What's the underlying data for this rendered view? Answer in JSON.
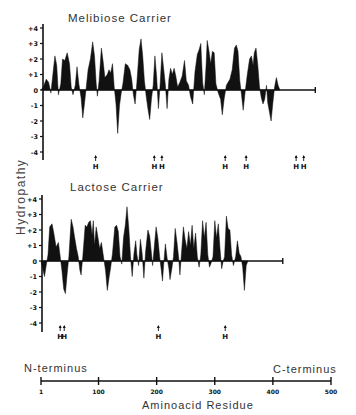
{
  "figure": {
    "ylabel": "Hydropathy",
    "xlabel": "Aminoacid Residue",
    "n_terminus_label": "N-terminus",
    "c_terminus_label": "C-terminus",
    "ink_color": "#111111"
  },
  "chart_data": [
    {
      "type": "area",
      "title": "Melibiose Carrier",
      "ylabel": "Hydropathy",
      "xlabel": "Aminoacid Residue",
      "ylim": [
        -4,
        4
      ],
      "yticks": [
        "+4",
        "+3",
        "+2",
        "+1",
        "0",
        "-1",
        "-2",
        "-3",
        "-4"
      ],
      "xlim": [
        1,
        500
      ],
      "sequence_end": 473,
      "profile": [
        [
          1,
          0
        ],
        [
          5,
          0.2
        ],
        [
          10,
          0.7
        ],
        [
          14,
          0.5
        ],
        [
          18,
          -0.2
        ],
        [
          22,
          1.2
        ],
        [
          25,
          2.2
        ],
        [
          28,
          1.6
        ],
        [
          31,
          -0.3
        ],
        [
          35,
          0.4
        ],
        [
          38,
          2.0
        ],
        [
          42,
          1.9
        ],
        [
          46,
          2.4
        ],
        [
          50,
          1.7
        ],
        [
          53,
          0.2
        ],
        [
          56,
          -0.3
        ],
        [
          60,
          0.3
        ],
        [
          63,
          1.5
        ],
        [
          66,
          0.4
        ],
        [
          70,
          -0.5
        ],
        [
          73,
          -1.8
        ],
        [
          76,
          -0.8
        ],
        [
          79,
          0.2
        ],
        [
          82,
          1.3
        ],
        [
          86,
          2.0
        ],
        [
          90,
          3.1
        ],
        [
          93,
          2.2
        ],
        [
          96,
          0.4
        ],
        [
          98,
          -0.4
        ],
        [
          101,
          0.6
        ],
        [
          105,
          2.7
        ],
        [
          108,
          1.8
        ],
        [
          111,
          0.8
        ],
        [
          115,
          1.0
        ],
        [
          118,
          1.3
        ],
        [
          121,
          1.1
        ],
        [
          124,
          1.7
        ],
        [
          127,
          0.2
        ],
        [
          130,
          -0.9
        ],
        [
          133,
          -2.8
        ],
        [
          136,
          -1.0
        ],
        [
          139,
          -0.2
        ],
        [
          142,
          0.4
        ],
        [
          146,
          1.7
        ],
        [
          150,
          1.6
        ],
        [
          154,
          1.3
        ],
        [
          157,
          0.7
        ],
        [
          160,
          -0.3
        ],
        [
          163,
          -0.9
        ],
        [
          166,
          0.5
        ],
        [
          170,
          2.6
        ],
        [
          173,
          3.3
        ],
        [
          176,
          2.2
        ],
        [
          179,
          0.6
        ],
        [
          182,
          -0.4
        ],
        [
          185,
          -1.2
        ],
        [
          188,
          -1.9
        ],
        [
          191,
          -0.6
        ],
        [
          194,
          0.3
        ],
        [
          197,
          2.2
        ],
        [
          200,
          0.8
        ],
        [
          203,
          -1.2
        ],
        [
          206,
          0.3
        ],
        [
          209,
          2.4
        ],
        [
          212,
          1.4
        ],
        [
          215,
          0.3
        ],
        [
          218,
          -1.2
        ],
        [
          221,
          0.7
        ],
        [
          224,
          1.4
        ],
        [
          227,
          1.0
        ],
        [
          230,
          1.4
        ],
        [
          233,
          0.9
        ],
        [
          236,
          0.2
        ],
        [
          240,
          0.5
        ],
        [
          244,
          0.9
        ],
        [
          248,
          1.9
        ],
        [
          251,
          0.6
        ],
        [
          255,
          0.3
        ],
        [
          258,
          -0.4
        ],
        [
          262,
          -0.9
        ],
        [
          266,
          1.2
        ],
        [
          270,
          2.3
        ],
        [
          273,
          2.6
        ],
        [
          276,
          3.0
        ],
        [
          279,
          0.5
        ],
        [
          282,
          -0.3
        ],
        [
          285,
          1.6
        ],
        [
          287,
          3.2
        ],
        [
          290,
          2.5
        ],
        [
          293,
          1.7
        ],
        [
          296,
          2.5
        ],
        [
          299,
          2.4
        ],
        [
          302,
          0.4
        ],
        [
          306,
          -0.2
        ],
        [
          310,
          -0.6
        ],
        [
          313,
          -1.6
        ],
        [
          316,
          -0.6
        ],
        [
          320,
          0.3
        ],
        [
          323,
          0.5
        ],
        [
          326,
          0.7
        ],
        [
          330,
          1.3
        ],
        [
          334,
          2.7
        ],
        [
          337,
          2.9
        ],
        [
          340,
          2.5
        ],
        [
          343,
          0.6
        ],
        [
          346,
          -0.3
        ],
        [
          349,
          -1.3
        ],
        [
          352,
          -0.2
        ],
        [
          356,
          1.0
        ],
        [
          360,
          2.0
        ],
        [
          363,
          2.2
        ],
        [
          366,
          1.6
        ],
        [
          368,
          2.4
        ],
        [
          371,
          2.7
        ],
        [
          374,
          1.6
        ],
        [
          377,
          0.2
        ],
        [
          380,
          -0.5
        ],
        [
          383,
          -0.9
        ],
        [
          386,
          -0.6
        ],
        [
          389,
          0.3
        ],
        [
          391,
          -0.8
        ],
        [
          394,
          -1.4
        ],
        [
          397,
          -2.0
        ],
        [
          400,
          -0.8
        ],
        [
          403,
          0.2
        ],
        [
          406,
          0.8
        ],
        [
          409,
          0.3
        ],
        [
          412,
          0
        ]
      ],
      "helix_breaker_markers": {
        "label": "H",
        "positions": [
          95,
          196,
          209,
          318,
          354,
          440,
          453
        ]
      }
    },
    {
      "type": "area",
      "title": "Lactose Carrier",
      "ylabel": "Hydropathy",
      "xlabel": "Aminoacid Residue",
      "ylim": [
        -4,
        4
      ],
      "yticks": [
        "+4",
        "+3",
        "+2",
        "+1",
        "0",
        "-1",
        "-2",
        "-3",
        "-4"
      ],
      "xlim": [
        1,
        500
      ],
      "sequence_end": 417,
      "profile": [
        [
          1,
          0
        ],
        [
          4,
          -0.5
        ],
        [
          7,
          -1.0
        ],
        [
          10,
          -0.3
        ],
        [
          13,
          0.4
        ],
        [
          16,
          2.2
        ],
        [
          20,
          2.4
        ],
        [
          23,
          1.8
        ],
        [
          27,
          0.9
        ],
        [
          31,
          1.2
        ],
        [
          34,
          0.3
        ],
        [
          37,
          -0.6
        ],
        [
          40,
          -1.8
        ],
        [
          43,
          -2.1
        ],
        [
          46,
          -0.8
        ],
        [
          49,
          0.3
        ],
        [
          53,
          2.7
        ],
        [
          56,
          2.2
        ],
        [
          59,
          1.5
        ],
        [
          62,
          0.8
        ],
        [
          65,
          0.3
        ],
        [
          68,
          -0.6
        ],
        [
          70,
          -0.9
        ],
        [
          73,
          0.3
        ],
        [
          77,
          2.3
        ],
        [
          80,
          2.2
        ],
        [
          83,
          2.5
        ],
        [
          86,
          2.6
        ],
        [
          89,
          1.7
        ],
        [
          91,
          2.6
        ],
        [
          93,
          1.0
        ],
        [
          96,
          2.2
        ],
        [
          99,
          1.5
        ],
        [
          102,
          0.8
        ],
        [
          105,
          1.2
        ],
        [
          108,
          0.4
        ],
        [
          112,
          -0.6
        ],
        [
          115,
          -1.9
        ],
        [
          118,
          -1.1
        ],
        [
          121,
          -0.4
        ],
        [
          124,
          0.5
        ],
        [
          128,
          2.2
        ],
        [
          131,
          2.3
        ],
        [
          134,
          1.9
        ],
        [
          137,
          0.3
        ],
        [
          140,
          -0.2
        ],
        [
          143,
          1.5
        ],
        [
          146,
          2.3
        ],
        [
          149,
          3.5
        ],
        [
          152,
          2.1
        ],
        [
          155,
          0.3
        ],
        [
          158,
          -1.0
        ],
        [
          161,
          0.5
        ],
        [
          164,
          1.3
        ],
        [
          166,
          0.4
        ],
        [
          169,
          -0.3
        ],
        [
          172,
          1.4
        ],
        [
          175,
          0.5
        ],
        [
          178,
          -1.1
        ],
        [
          181,
          0.6
        ],
        [
          185,
          2.0
        ],
        [
          188,
          1.6
        ],
        [
          190,
          0.9
        ],
        [
          193,
          -0.3
        ],
        [
          196,
          0.9
        ],
        [
          199,
          2.2
        ],
        [
          202,
          1.5
        ],
        [
          205,
          0.3
        ],
        [
          208,
          -0.6
        ],
        [
          210,
          -1.3
        ],
        [
          212,
          -0.3
        ],
        [
          215,
          1.1
        ],
        [
          218,
          0.2
        ],
        [
          221,
          -0.5
        ],
        [
          223,
          -1.2
        ],
        [
          226,
          -0.5
        ],
        [
          229,
          0.3
        ],
        [
          232,
          2.1
        ],
        [
          235,
          1.2
        ],
        [
          238,
          0.2
        ],
        [
          240,
          -0.9
        ],
        [
          243,
          0.6
        ],
        [
          246,
          2.2
        ],
        [
          249,
          1.4
        ],
        [
          252,
          0.8
        ],
        [
          255,
          1.9
        ],
        [
          258,
          1.0
        ],
        [
          261,
          2.3
        ],
        [
          264,
          0.8
        ],
        [
          267,
          1.8
        ],
        [
          270,
          0.3
        ],
        [
          273,
          -0.4
        ],
        [
          276,
          0.4
        ],
        [
          279,
          2.6
        ],
        [
          282,
          1.5
        ],
        [
          285,
          2.5
        ],
        [
          288,
          0.4
        ],
        [
          291,
          -0.4
        ],
        [
          294,
          -0.1
        ],
        [
          297,
          0.3
        ],
        [
          300,
          2.6
        ],
        [
          303,
          1.5
        ],
        [
          306,
          2.4
        ],
        [
          309,
          0.8
        ],
        [
          312,
          -0.5
        ],
        [
          314,
          -0.1
        ],
        [
          317,
          0.3
        ],
        [
          320,
          2.9
        ],
        [
          323,
          2.1
        ],
        [
          326,
          2.0
        ],
        [
          329,
          0.4
        ],
        [
          332,
          -0.3
        ],
        [
          336,
          0.3
        ],
        [
          339,
          1.3
        ],
        [
          342,
          0.5
        ],
        [
          345,
          0.3
        ],
        [
          348,
          -0.4
        ],
        [
          351,
          -1.9
        ],
        [
          354,
          -0.3
        ],
        [
          357,
          0
        ]
      ],
      "helix_breaker_markers": {
        "label": "H",
        "positions": [
          34,
          41,
          203,
          318
        ]
      }
    },
    {
      "type": "axis",
      "title": "Aminoacid Residue",
      "ticks": [
        1,
        100,
        200,
        300,
        400,
        500
      ],
      "tick_labels": [
        "1",
        "100",
        "200",
        "300",
        "400",
        "500"
      ],
      "left_label": "N-terminus",
      "right_label": "C-terminus"
    }
  ]
}
